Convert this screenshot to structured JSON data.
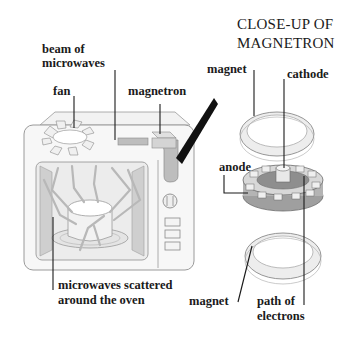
{
  "diagram": {
    "title_line1": "CLOSE-UP OF",
    "title_line2": "MAGNETRON",
    "oven_labels": {
      "beam_line1": "beam of",
      "beam_line2": "microwaves",
      "fan": "fan",
      "magnetron": "magnetron",
      "scattered_line1": "microwaves scattered",
      "scattered_line2": "around the oven"
    },
    "magnetron_labels": {
      "magnet_top": "magnet",
      "cathode": "cathode",
      "anode": "anode",
      "magnet_bottom": "magnet",
      "path_line1": "path of",
      "path_line2": "electrons"
    },
    "colors": {
      "outline": "#8a8a8a",
      "oven_fill": "#f4f4f4",
      "shade": "#cfcfcf",
      "dark_shade": "#9a9a9a",
      "text": "#1a1a1a",
      "leader": "#1a1a1a"
    }
  }
}
